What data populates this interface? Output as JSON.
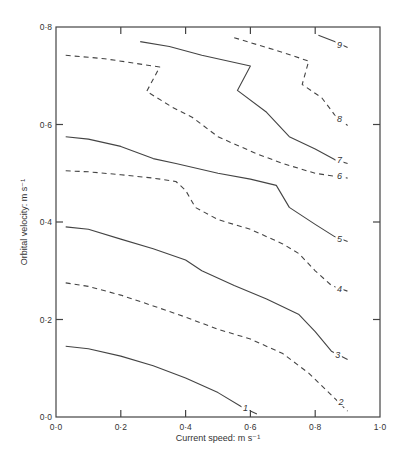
{
  "chart_data": {
    "type": "contour",
    "title": "",
    "xlabel": "Current speed: m s⁻¹",
    "ylabel": "Orbital velocity: m s⁻¹",
    "xlim": [
      0.0,
      1.0
    ],
    "ylim": [
      0.0,
      0.8
    ],
    "xticks": [
      0.0,
      0.2,
      0.4,
      0.6,
      0.8,
      1.0
    ],
    "xtick_labels": [
      "0·0",
      "0·2",
      "0·4",
      "0·6",
      "0·8",
      "1·0"
    ],
    "yticks": [
      0.0,
      0.2,
      0.4,
      0.6,
      0.8
    ],
    "ytick_labels": [
      "0·0",
      "0·2",
      "0·4",
      "0·6",
      "0·8"
    ],
    "grid": false,
    "legend": null,
    "contours": [
      {
        "level": 1,
        "style": "solid",
        "label_at": [
          0.585,
          0.018
        ],
        "points": [
          [
            0.03,
            0.145
          ],
          [
            0.1,
            0.14
          ],
          [
            0.2,
            0.125
          ],
          [
            0.3,
            0.105
          ],
          [
            0.4,
            0.08
          ],
          [
            0.5,
            0.05
          ],
          [
            0.57,
            0.022
          ],
          [
            0.6,
            0.012
          ],
          [
            0.62,
            0.006
          ]
        ]
      },
      {
        "level": 2,
        "style": "dashed",
        "label_at": [
          0.88,
          0.03
        ],
        "points": [
          [
            0.03,
            0.275
          ],
          [
            0.1,
            0.268
          ],
          [
            0.2,
            0.25
          ],
          [
            0.3,
            0.228
          ],
          [
            0.4,
            0.205
          ],
          [
            0.5,
            0.18
          ],
          [
            0.6,
            0.16
          ],
          [
            0.7,
            0.13
          ],
          [
            0.78,
            0.09
          ],
          [
            0.85,
            0.045
          ],
          [
            0.9,
            0.012
          ]
        ]
      },
      {
        "level": 3,
        "style": "solid",
        "label_at": [
          0.87,
          0.128
        ],
        "points": [
          [
            0.03,
            0.39
          ],
          [
            0.1,
            0.385
          ],
          [
            0.2,
            0.365
          ],
          [
            0.3,
            0.345
          ],
          [
            0.4,
            0.322
          ],
          [
            0.45,
            0.3
          ],
          [
            0.55,
            0.27
          ],
          [
            0.65,
            0.242
          ],
          [
            0.75,
            0.21
          ],
          [
            0.8,
            0.175
          ],
          [
            0.85,
            0.135
          ],
          [
            0.9,
            0.118
          ]
        ]
      },
      {
        "level": 4,
        "style": "dashed",
        "label_at": [
          0.875,
          0.262
        ],
        "points": [
          [
            0.03,
            0.505
          ],
          [
            0.1,
            0.503
          ],
          [
            0.2,
            0.497
          ],
          [
            0.3,
            0.49
          ],
          [
            0.37,
            0.483
          ],
          [
            0.4,
            0.465
          ],
          [
            0.43,
            0.43
          ],
          [
            0.5,
            0.405
          ],
          [
            0.6,
            0.385
          ],
          [
            0.7,
            0.355
          ],
          [
            0.75,
            0.335
          ],
          [
            0.8,
            0.3
          ],
          [
            0.85,
            0.27
          ],
          [
            0.9,
            0.258
          ]
        ]
      },
      {
        "level": 5,
        "style": "solid",
        "label_at": [
          0.875,
          0.365
        ],
        "points": [
          [
            0.03,
            0.575
          ],
          [
            0.1,
            0.57
          ],
          [
            0.2,
            0.555
          ],
          [
            0.3,
            0.53
          ],
          [
            0.37,
            0.52
          ],
          [
            0.5,
            0.5
          ],
          [
            0.6,
            0.488
          ],
          [
            0.68,
            0.475
          ],
          [
            0.72,
            0.43
          ],
          [
            0.8,
            0.395
          ],
          [
            0.86,
            0.37
          ],
          [
            0.9,
            0.36
          ]
        ]
      },
      {
        "level": 6,
        "style": "dashed",
        "label_at": [
          0.875,
          0.495
        ],
        "points": [
          [
            0.03,
            0.742
          ],
          [
            0.15,
            0.735
          ],
          [
            0.3,
            0.72
          ],
          [
            0.32,
            0.718
          ],
          [
            0.28,
            0.668
          ],
          [
            0.36,
            0.635
          ],
          [
            0.42,
            0.615
          ],
          [
            0.5,
            0.575
          ],
          [
            0.55,
            0.56
          ],
          [
            0.62,
            0.54
          ],
          [
            0.7,
            0.52
          ],
          [
            0.8,
            0.5
          ],
          [
            0.9,
            0.49
          ]
        ]
      },
      {
        "level": 7,
        "style": "solid",
        "label_at": [
          0.875,
          0.527
        ],
        "points": [
          [
            0.26,
            0.77
          ],
          [
            0.35,
            0.76
          ],
          [
            0.45,
            0.742
          ],
          [
            0.6,
            0.72
          ],
          [
            0.56,
            0.67
          ],
          [
            0.65,
            0.625
          ],
          [
            0.72,
            0.575
          ],
          [
            0.8,
            0.55
          ],
          [
            0.86,
            0.528
          ],
          [
            0.9,
            0.52
          ]
        ]
      },
      {
        "level": 8,
        "style": "dashed",
        "label_at": [
          0.875,
          0.612
        ],
        "points": [
          [
            0.55,
            0.778
          ],
          [
            0.7,
            0.748
          ],
          [
            0.78,
            0.73
          ],
          [
            0.76,
            0.682
          ],
          [
            0.82,
            0.655
          ],
          [
            0.86,
            0.62
          ],
          [
            0.9,
            0.598
          ]
        ]
      },
      {
        "level": 9,
        "style": "solid",
        "label_at": [
          0.875,
          0.763
        ],
        "points": [
          [
            0.81,
            0.783
          ],
          [
            0.86,
            0.77
          ],
          [
            0.9,
            0.758
          ]
        ]
      }
    ],
    "contour_label_positions_note": "labels placed along lines near right end"
  }
}
